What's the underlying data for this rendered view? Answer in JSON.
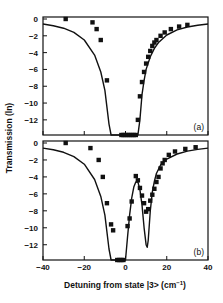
{
  "chart_data": [
    {
      "panel": "a",
      "type": "scatter",
      "title": "",
      "xlabel": "Detuning from state |3> (cm^-1)",
      "ylabel": "Transmission (ln)",
      "xlim": [
        -40,
        40
      ],
      "ylim": [
        -14,
        0.5
      ],
      "yticks": [
        0,
        -2,
        -4,
        -6,
        -8,
        -10,
        -12
      ],
      "xticks": [
        -40,
        -20,
        0,
        20,
        40
      ],
      "grid": false,
      "annotation": "(a)",
      "series": [
        {
          "name": "measured",
          "style": "square-markers",
          "x": [
            -29,
            -16,
            -14,
            -12,
            -9,
            -2,
            -1,
            0,
            1,
            2,
            3,
            4,
            5,
            6,
            7,
            8,
            9,
            10,
            11,
            12,
            13,
            14,
            15,
            17,
            19,
            22,
            26,
            30
          ],
          "y": [
            0,
            -0.4,
            -1.2,
            -2.5,
            -7.3,
            -13.8,
            -13.8,
            -13.8,
            -13.8,
            -13.8,
            -13.8,
            -13.8,
            -13.8,
            -12,
            -9.2,
            -7.5,
            -6.3,
            -5.3,
            -4.5,
            -3.8,
            -3.2,
            -2.8,
            -2.5,
            -2.0,
            -1.6,
            -1.2,
            -0.9,
            -0.7
          ]
        },
        {
          "name": "theory",
          "style": "solid-line",
          "x": [
            -40,
            -35,
            -30,
            -25,
            -20,
            -15,
            -12,
            -10,
            -8,
            -7,
            -6,
            6,
            7,
            8,
            9,
            10,
            12,
            14,
            16,
            20,
            25,
            30,
            35,
            40
          ],
          "y": [
            -0.6,
            -0.8,
            -1.1,
            -1.6,
            -2.5,
            -4.3,
            -6.3,
            -8.5,
            -12.5,
            -13.8,
            -13.8,
            -13.8,
            -12,
            -9,
            -7.3,
            -6,
            -4.5,
            -3.5,
            -2.8,
            -1.9,
            -1.3,
            -0.95,
            -0.75,
            -0.6
          ]
        }
      ]
    },
    {
      "panel": "b",
      "type": "scatter",
      "title": "",
      "xlabel": "Detuning from state |3> (cm^-1)",
      "ylabel": "Transmission (ln)",
      "xlim": [
        -40,
        40
      ],
      "ylim": [
        -14,
        0.5
      ],
      "yticks": [
        0,
        -2,
        -4,
        -6,
        -8,
        -10,
        -12
      ],
      "xticks": [
        -40,
        -20,
        0,
        20,
        40
      ],
      "grid": false,
      "annotation": "(b)",
      "series": [
        {
          "name": "measured",
          "style": "square-markers",
          "x": [
            -29,
            -17,
            -13,
            -11,
            -9,
            -7,
            -6,
            -4,
            -3,
            -2,
            -1,
            1,
            2,
            3,
            5,
            6,
            7,
            8,
            9,
            10,
            11,
            12,
            13,
            14,
            15,
            16,
            17,
            18,
            19,
            21,
            24,
            29,
            34
          ],
          "y": [
            0,
            -0.6,
            -2,
            -4,
            -7.1,
            -9.6,
            -10.3,
            -13.8,
            -13.8,
            -13.8,
            -13.8,
            -9.8,
            -8.9,
            -6.9,
            -3.9,
            -4.4,
            -5.3,
            -6.2,
            -7.1,
            -8.1,
            -7.8,
            -6.8,
            -6.1,
            -5.4,
            -4.6,
            -4.0,
            -3.0,
            -2.4,
            -2.0,
            -1.4,
            -1.0,
            -0.7,
            -0.5
          ]
        },
        {
          "name": "theory",
          "style": "solid-line",
          "x": [
            -40,
            -35,
            -30,
            -25,
            -20,
            -15,
            -12,
            -10,
            -8,
            -7,
            -6,
            0,
            1,
            2,
            3,
            4,
            5,
            6,
            7,
            8,
            9,
            10,
            10.5,
            11,
            12,
            13,
            14,
            15,
            17,
            20,
            25,
            30,
            35,
            40
          ],
          "y": [
            -0.6,
            -0.8,
            -1.1,
            -1.6,
            -2.5,
            -4.3,
            -6.3,
            -8.5,
            -12.5,
            -13.8,
            -13.8,
            -13.8,
            -11,
            -8.5,
            -6.5,
            -5.2,
            -4.6,
            -4.6,
            -5.5,
            -7.3,
            -10,
            -12.0,
            -12.3,
            -11.5,
            -8,
            -5.8,
            -4.5,
            -3.6,
            -2.6,
            -1.9,
            -1.3,
            -0.95,
            -0.75,
            -0.6
          ]
        }
      ]
    }
  ],
  "labels": {
    "xlabel": "Detuning from state |3> (cm",
    "xlabel_sup": "−1",
    "xlabel_end": ")",
    "ylabel": "Transmission (ln)",
    "panel_a": "(a)",
    "panel_b": "(b)"
  }
}
